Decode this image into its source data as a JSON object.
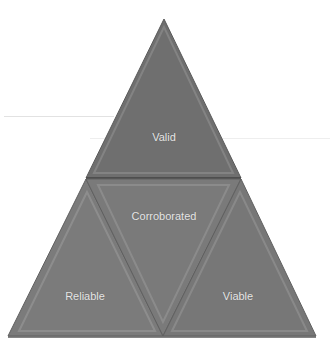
{
  "diagram": {
    "type": "triangle-pyramid",
    "segments": [
      {
        "id": "top",
        "label": "Valid",
        "color": "#6e6e6e"
      },
      {
        "id": "center",
        "label": "Corroborated",
        "color": "#7a7a7a"
      },
      {
        "id": "left",
        "label": "Reliable",
        "color": "#7b7b7b"
      },
      {
        "id": "right",
        "label": "Viable",
        "color": "#777777"
      }
    ],
    "label_color": "#e6e6e6",
    "background": "#ffffff"
  }
}
